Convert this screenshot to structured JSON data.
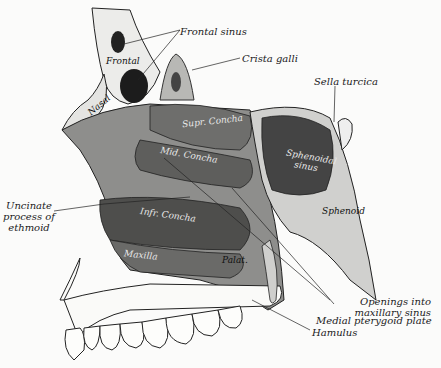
{
  "figure": {
    "type": "anatomical-illustration"
  },
  "external_labels": {
    "frontal_sinus": "Frontal sinus",
    "crista_galli": "Crista galli",
    "sella_turcica": "Sella turcica",
    "uncinate_1": "Uncinate",
    "uncinate_2": "process of",
    "uncinate_3": "ethmoid",
    "openings_1": "Openings into",
    "openings_2": "maxillary sinus",
    "medial_pterygoid": "Medial pterygoid plate",
    "hamulus": "Hamulus"
  },
  "internal_labels": {
    "frontal": "Frontal",
    "nasal": "Nasal",
    "supr_concha": "Supr. Concha",
    "mid_concha": "Mid. Concha",
    "infr_concha": "Infr. Concha",
    "maxilla": "Maxilla",
    "palat": "Palat.",
    "sphenoidal_sinus_1": "Sphenoidal",
    "sphenoidal_sinus_2": "sinus",
    "sphenoid": "Sphenoid"
  },
  "colors": {
    "background": "#fbfbfa",
    "ink": "#1a1a1a",
    "bone_light": "#e6e6e3",
    "bone_mid": "#9a9a98",
    "bone_dark": "#555555",
    "cavity": "#2a2a2a"
  }
}
